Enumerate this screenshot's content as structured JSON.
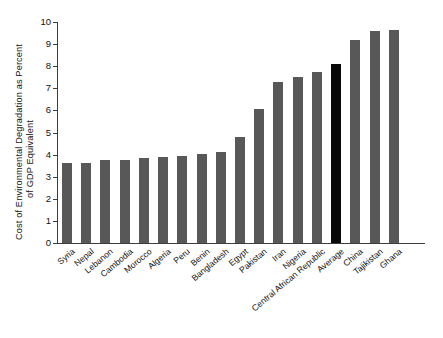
{
  "chart_data": {
    "type": "bar",
    "title": "",
    "xlabel": "",
    "ylabel": "Cost of Environmental Degradation as Percent of GDP Equivalent",
    "ylabel_lines": [
      "Cost of Environmental Degradation as Percent",
      "of GDP Equivalent"
    ],
    "ylim": [
      0,
      10
    ],
    "ytick_labels": [
      "0",
      "1",
      "2",
      "3",
      "4",
      "5",
      "6",
      "7",
      "8",
      "9",
      "10"
    ],
    "ytick_values": [
      0,
      1,
      2,
      3,
      4,
      5,
      6,
      7,
      8,
      9,
      10
    ],
    "grid": false,
    "legend": false,
    "categories": [
      "Syria",
      "Nepal",
      "Lebanon",
      "Cambodia",
      "Morocco",
      "Algeria",
      "Peru",
      "Benin",
      "Bangladesh",
      "Egypt",
      "Pakistan",
      "Iran",
      "Nigeria",
      "Central African Republic",
      "Average",
      "China",
      "Tajikistan",
      "Ghana"
    ],
    "values": [
      3.6,
      3.6,
      3.75,
      3.75,
      3.85,
      3.9,
      3.95,
      4.05,
      4.1,
      4.8,
      6.05,
      7.3,
      7.5,
      7.75,
      8.1,
      9.2,
      9.6,
      9.65
    ],
    "highlight_category": "Average",
    "bar_color": "#585858",
    "highlight_color": "#090909",
    "axis_color": "#3d3d3d",
    "background_color": "#ffffff"
  }
}
